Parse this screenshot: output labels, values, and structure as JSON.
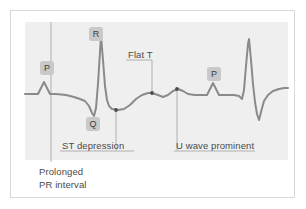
{
  "figure": {
    "type": "ecg-waveform-diagram",
    "background_color": "#ffffff",
    "panel_color": "#efefef",
    "frame_color": "#d8d8d8",
    "trace_color": "#8a8a8a",
    "leader_color": "#a8a8a8",
    "marker_color": "#4d4d4d",
    "tag_background": "#c9c9c9",
    "text_color": "#4a4a4a"
  },
  "wave_tags": [
    {
      "id": "p1",
      "label": "P"
    },
    {
      "id": "r",
      "label": "R"
    },
    {
      "id": "q",
      "label": "Q"
    },
    {
      "id": "p2",
      "label": "P"
    }
  ],
  "annotations": {
    "flat_t": "Flat T",
    "st_depression": "ST depression",
    "u_wave": "U wave prominent"
  },
  "captions": {
    "prolonged_line1": "Prolonged",
    "prolonged_line2": "PR interval"
  },
  "chart_data": {
    "type": "line",
    "title": "",
    "xlabel": "",
    "ylabel": "",
    "grid": false,
    "legend": null,
    "baseline_y": 94,
    "xlim": [
      25,
      288
    ],
    "ylim": [
      22,
      160
    ],
    "series": [
      {
        "name": "ecg-trace",
        "color": "#8a8a8a",
        "points": [
          [
            25,
            94
          ],
          [
            33,
            94
          ],
          [
            38,
            94
          ],
          [
            41,
            88
          ],
          [
            44,
            82
          ],
          [
            47,
            88
          ],
          [
            50,
            94
          ],
          [
            56,
            94
          ],
          [
            66,
            95
          ],
          [
            74,
            97
          ],
          [
            80,
            99
          ],
          [
            85,
            101
          ],
          [
            89,
            106
          ],
          [
            92,
            113
          ],
          [
            94,
            116
          ],
          [
            96,
            108
          ],
          [
            98,
            84
          ],
          [
            100,
            52
          ],
          [
            101,
            36
          ],
          [
            103,
            60
          ],
          [
            105,
            86
          ],
          [
            107,
            100
          ],
          [
            109,
            106
          ],
          [
            112,
            109
          ],
          [
            118,
            110
          ],
          [
            124,
            109
          ],
          [
            130,
            105
          ],
          [
            136,
            99
          ],
          [
            142,
            95
          ],
          [
            148,
            93
          ],
          [
            152,
            93
          ],
          [
            158,
            95
          ],
          [
            163,
            97
          ],
          [
            168,
            95
          ],
          [
            173,
            91
          ],
          [
            178,
            89
          ],
          [
            183,
            91
          ],
          [
            188,
            94
          ],
          [
            195,
            95
          ],
          [
            203,
            95
          ],
          [
            207,
            95
          ],
          [
            210,
            89
          ],
          [
            213,
            83
          ],
          [
            216,
            89
          ],
          [
            219,
            95
          ],
          [
            226,
            95
          ],
          [
            234,
            95
          ],
          [
            239,
            96
          ],
          [
            242,
            99
          ],
          [
            244,
            90
          ],
          [
            246,
            66
          ],
          [
            248,
            44
          ],
          [
            249,
            39
          ],
          [
            251,
            60
          ],
          [
            253,
            84
          ],
          [
            255,
            102
          ],
          [
            257,
            114
          ],
          [
            259,
            120
          ],
          [
            261,
            112
          ],
          [
            264,
            101
          ],
          [
            268,
            95
          ],
          [
            273,
            91
          ],
          [
            279,
            89
          ],
          [
            284,
            88
          ],
          [
            288,
            88
          ]
        ]
      }
    ],
    "markers": [
      {
        "name": "st-depression-point",
        "x": 116,
        "y": 110
      },
      {
        "name": "flat-t-point",
        "x": 152,
        "y": 93
      },
      {
        "name": "u-wave-point",
        "x": 177,
        "y": 89
      }
    ],
    "leader_lines": [
      {
        "name": "pr-interval-leader",
        "x1": 51,
        "y1": 22,
        "x2": 51,
        "y2": 162
      },
      {
        "name": "st-depression-leader",
        "x1": 116,
        "y1": 110,
        "x2": 116,
        "y2": 150
      },
      {
        "name": "flat-t-leader",
        "x1": 152,
        "y1": 60,
        "x2": 152,
        "y2": 93
      },
      {
        "name": "u-wave-leader",
        "x1": 177,
        "y1": 89,
        "x2": 177,
        "y2": 150
      }
    ],
    "underlines": [
      {
        "name": "flat-t-underline",
        "x1": 126,
        "y1": 60,
        "x2": 152,
        "y2": 60
      },
      {
        "name": "st-depression-underline",
        "x1": 60,
        "y1": 151,
        "x2": 134,
        "y2": 151
      },
      {
        "name": "u-wave-underline",
        "x1": 174,
        "y1": 151,
        "x2": 255,
        "y2": 151
      }
    ]
  }
}
